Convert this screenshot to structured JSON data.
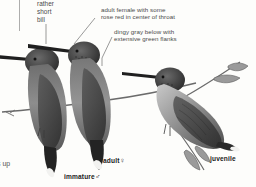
{
  "plate": {
    "title": "Hummingbird identification plate",
    "background_color": "#fdfdfb",
    "ink_color": "#4a4a4a",
    "caption_color": "#1b1b1b"
  },
  "callouts": [
    {
      "id": "bill",
      "lines": [
        "rather",
        "short",
        "bill"
      ]
    },
    {
      "id": "female-throat",
      "lines": [
        "adult female with some",
        "rose red in center of throat"
      ]
    },
    {
      "id": "underparts",
      "lines": [
        "dingy gray below with",
        "extensive green flanks"
      ]
    }
  ],
  "captions": [
    {
      "id": "immature-male",
      "label": "immature",
      "symbol": "♂"
    },
    {
      "id": "adult-female",
      "label": "adult",
      "symbol": "♀"
    },
    {
      "id": "juvenile",
      "label": "juvenile",
      "symbol": ""
    }
  ],
  "edge_text": {
    "left_clipped": "s up"
  },
  "figures": [
    {
      "id": "bird-immature-male",
      "pose": "perched, facing left"
    },
    {
      "id": "bird-adult-female",
      "pose": "perched, facing left"
    },
    {
      "id": "bird-juvenile",
      "pose": "perched on branch, facing left"
    }
  ]
}
